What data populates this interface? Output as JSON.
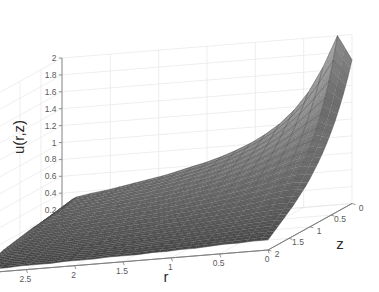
{
  "figure": {
    "background_color": "#ffffff",
    "width": 379,
    "height": 292
  },
  "chart_data": {
    "type": "surface",
    "title": "",
    "subtitle": "",
    "zlabel": "u(r,z)",
    "xlabel": "r",
    "ylabel": "z",
    "grid": true,
    "legend": "none",
    "mesh": true,
    "colormap": "gray",
    "shading": "faceted",
    "view": {
      "azimuth_hint": "r axis decreasing left-to-right, z axis increasing toward viewer-left-front"
    },
    "zticks": [
      0,
      0.2,
      0.4,
      0.6,
      0.8,
      1,
      1.2,
      1.4,
      1.6,
      1.8,
      2
    ],
    "zticklabels": [
      "0",
      "0.2",
      "0.4",
      "0.6",
      "0.8",
      "1",
      "1.2",
      "1.4",
      "1.6",
      "1.8",
      "2"
    ],
    "zlim": [
      0,
      2
    ],
    "xticks": [
      3,
      2.5,
      2,
      1.5,
      1,
      0.5,
      0
    ],
    "xticklabels": [
      "3",
      "2.5",
      "2",
      "1.5",
      "1",
      "0.5",
      "0"
    ],
    "xlim": [
      0,
      3
    ],
    "yticks": [
      0,
      0.5,
      1,
      1.5,
      2
    ],
    "yticklabels": [
      "0",
      "0.5",
      "1",
      "1.5",
      "2"
    ],
    "ylim": [
      0,
      2
    ],
    "surface_description": "Axisymmetric solution u(r,z) with a sharp spike of height 2 near r=0.5, z=0; surface decays monotonically toward u=0.2 at r=3 and toward u=0 at z=2.",
    "peak": {
      "r": 0.5,
      "z": 0.0,
      "u": 2.0
    },
    "r_grid": [
      0,
      0.15,
      0.3,
      0.45,
      0.6,
      0.75,
      0.9,
      1.05,
      1.2,
      1.35,
      1.5,
      1.65,
      1.8,
      1.95,
      2.1,
      2.25,
      2.4,
      2.55,
      2.7,
      2.85,
      3
    ],
    "z_grid": [
      0,
      0.1,
      0.2,
      0.3,
      0.4,
      0.5,
      0.6,
      0.7,
      0.8,
      0.9,
      1,
      1.1,
      1.2,
      1.3,
      1.4,
      1.5,
      1.6,
      1.7,
      1.8,
      1.9,
      2
    ],
    "u_values": [
      [
        1.7,
        1.52,
        1.36,
        1.22,
        1.09,
        0.98,
        0.88,
        0.79,
        0.71,
        0.64,
        0.57,
        0.51,
        0.46,
        0.41,
        0.36,
        0.32,
        0.28,
        0.24,
        0.2,
        0.16,
        0.12
      ],
      [
        2.0,
        1.74,
        1.52,
        1.34,
        1.18,
        1.04,
        0.92,
        0.82,
        0.73,
        0.65,
        0.58,
        0.52,
        0.46,
        0.41,
        0.36,
        0.32,
        0.28,
        0.24,
        0.2,
        0.16,
        0.12
      ],
      [
        1.64,
        1.48,
        1.33,
        1.2,
        1.08,
        0.97,
        0.87,
        0.78,
        0.7,
        0.63,
        0.56,
        0.5,
        0.45,
        0.4,
        0.35,
        0.31,
        0.27,
        0.23,
        0.19,
        0.15,
        0.11
      ],
      [
        1.36,
        1.26,
        1.16,
        1.06,
        0.97,
        0.88,
        0.8,
        0.72,
        0.65,
        0.58,
        0.52,
        0.47,
        0.42,
        0.37,
        0.33,
        0.29,
        0.25,
        0.22,
        0.18,
        0.14,
        0.11
      ],
      [
        1.16,
        1.09,
        1.02,
        0.94,
        0.87,
        0.8,
        0.73,
        0.66,
        0.6,
        0.54,
        0.49,
        0.44,
        0.39,
        0.35,
        0.31,
        0.27,
        0.24,
        0.2,
        0.17,
        0.13,
        0.1
      ],
      [
        1.01,
        0.96,
        0.9,
        0.84,
        0.78,
        0.72,
        0.67,
        0.61,
        0.56,
        0.5,
        0.46,
        0.41,
        0.37,
        0.33,
        0.29,
        0.26,
        0.22,
        0.19,
        0.16,
        0.13,
        0.09
      ],
      [
        0.9,
        0.86,
        0.81,
        0.76,
        0.71,
        0.66,
        0.61,
        0.56,
        0.52,
        0.47,
        0.43,
        0.39,
        0.35,
        0.31,
        0.28,
        0.24,
        0.21,
        0.18,
        0.15,
        0.12,
        0.09
      ],
      [
        0.81,
        0.78,
        0.74,
        0.69,
        0.65,
        0.61,
        0.57,
        0.52,
        0.48,
        0.44,
        0.4,
        0.37,
        0.33,
        0.3,
        0.26,
        0.23,
        0.2,
        0.17,
        0.14,
        0.11,
        0.08
      ],
      [
        0.74,
        0.71,
        0.68,
        0.64,
        0.6,
        0.56,
        0.53,
        0.49,
        0.45,
        0.42,
        0.38,
        0.35,
        0.31,
        0.28,
        0.25,
        0.22,
        0.19,
        0.16,
        0.14,
        0.11,
        0.08
      ],
      [
        0.68,
        0.66,
        0.63,
        0.6,
        0.56,
        0.53,
        0.49,
        0.46,
        0.43,
        0.39,
        0.36,
        0.33,
        0.3,
        0.27,
        0.24,
        0.21,
        0.18,
        0.15,
        0.13,
        0.1,
        0.07
      ],
      [
        0.63,
        0.61,
        0.58,
        0.56,
        0.53,
        0.5,
        0.47,
        0.43,
        0.4,
        0.37,
        0.34,
        0.31,
        0.28,
        0.25,
        0.22,
        0.2,
        0.17,
        0.14,
        0.12,
        0.09,
        0.07
      ],
      [
        0.59,
        0.57,
        0.55,
        0.52,
        0.5,
        0.47,
        0.44,
        0.41,
        0.38,
        0.35,
        0.32,
        0.3,
        0.27,
        0.24,
        0.21,
        0.19,
        0.16,
        0.14,
        0.11,
        0.09,
        0.07
      ],
      [
        0.55,
        0.53,
        0.51,
        0.49,
        0.47,
        0.44,
        0.42,
        0.39,
        0.36,
        0.34,
        0.31,
        0.28,
        0.26,
        0.23,
        0.2,
        0.18,
        0.15,
        0.13,
        0.11,
        0.08,
        0.06
      ],
      [
        0.51,
        0.5,
        0.48,
        0.46,
        0.44,
        0.42,
        0.4,
        0.37,
        0.35,
        0.32,
        0.29,
        0.27,
        0.24,
        0.22,
        0.19,
        0.17,
        0.15,
        0.12,
        0.1,
        0.08,
        0.06
      ],
      [
        0.48,
        0.47,
        0.45,
        0.44,
        0.42,
        0.4,
        0.38,
        0.35,
        0.33,
        0.3,
        0.28,
        0.26,
        0.23,
        0.21,
        0.18,
        0.16,
        0.14,
        0.12,
        0.1,
        0.08,
        0.06
      ],
      [
        0.45,
        0.44,
        0.43,
        0.41,
        0.39,
        0.38,
        0.36,
        0.34,
        0.31,
        0.29,
        0.27,
        0.24,
        0.22,
        0.2,
        0.18,
        0.15,
        0.13,
        0.11,
        0.09,
        0.07,
        0.05
      ],
      [
        0.42,
        0.41,
        0.4,
        0.39,
        0.37,
        0.36,
        0.34,
        0.32,
        0.3,
        0.28,
        0.25,
        0.23,
        0.21,
        0.19,
        0.17,
        0.15,
        0.13,
        0.11,
        0.09,
        0.07,
        0.05
      ],
      [
        0.39,
        0.39,
        0.38,
        0.36,
        0.35,
        0.34,
        0.32,
        0.3,
        0.28,
        0.26,
        0.24,
        0.22,
        0.2,
        0.18,
        0.16,
        0.14,
        0.12,
        0.1,
        0.08,
        0.06,
        0.05
      ],
      [
        0.37,
        0.36,
        0.35,
        0.34,
        0.33,
        0.32,
        0.3,
        0.29,
        0.27,
        0.25,
        0.23,
        0.21,
        0.19,
        0.17,
        0.15,
        0.13,
        0.11,
        0.1,
        0.08,
        0.06,
        0.04
      ],
      [
        0.34,
        0.34,
        0.33,
        0.32,
        0.31,
        0.3,
        0.29,
        0.27,
        0.25,
        0.24,
        0.22,
        0.2,
        0.18,
        0.16,
        0.14,
        0.13,
        0.11,
        0.09,
        0.07,
        0.06,
        0.04
      ],
      [
        0.2,
        0.2,
        0.2,
        0.2,
        0.19,
        0.19,
        0.18,
        0.18,
        0.17,
        0.16,
        0.15,
        0.14,
        0.13,
        0.12,
        0.11,
        0.09,
        0.08,
        0.07,
        0.06,
        0.04,
        0.03
      ]
    ]
  },
  "axes": {
    "z_axis_title": "u(r,z)",
    "x_axis_title": "r",
    "y_axis_title": "z"
  },
  "style": {
    "axis_color": "#7a7a7a",
    "grid_color": "#e2e2e2",
    "tick_label_color": "#5a5a5a",
    "title_color": "#2b2b2b",
    "surface_light": "#f0f0f0",
    "surface_dark": "#3c3c3c",
    "mesh_line_color": "#555555"
  }
}
